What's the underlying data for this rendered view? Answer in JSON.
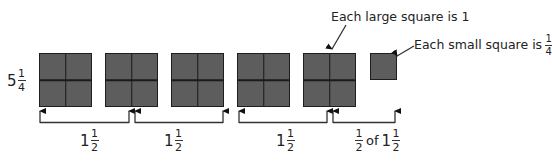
{
  "total": {
    "whole": "5",
    "numerator": "1",
    "denominator": "4"
  },
  "large_squares": [
    {
      "label": "large-square-1"
    },
    {
      "label": "large-square-2"
    },
    {
      "label": "large-square-3"
    },
    {
      "label": "large-square-4"
    },
    {
      "label": "large-square-5"
    }
  ],
  "small_square": {
    "label": "small-square"
  },
  "annotations": {
    "large": {
      "text": "Each large square is 1"
    },
    "small": {
      "text": "Each small square is",
      "numerator": "1",
      "denominator": "4"
    }
  },
  "groups": [
    {
      "whole": "1",
      "numerator": "1",
      "denominator": "2"
    },
    {
      "whole": "1",
      "numerator": "1",
      "denominator": "2"
    },
    {
      "whole": "1",
      "numerator": "1",
      "denominator": "2"
    },
    {
      "prefix_numerator": "1",
      "prefix_denominator": "2",
      "of": "of",
      "whole": "1",
      "numerator": "1",
      "denominator": "2"
    }
  ],
  "colors": {
    "square_fill": "#5d5d5d",
    "square_border": "#1e1e1e",
    "line": "#333333"
  }
}
